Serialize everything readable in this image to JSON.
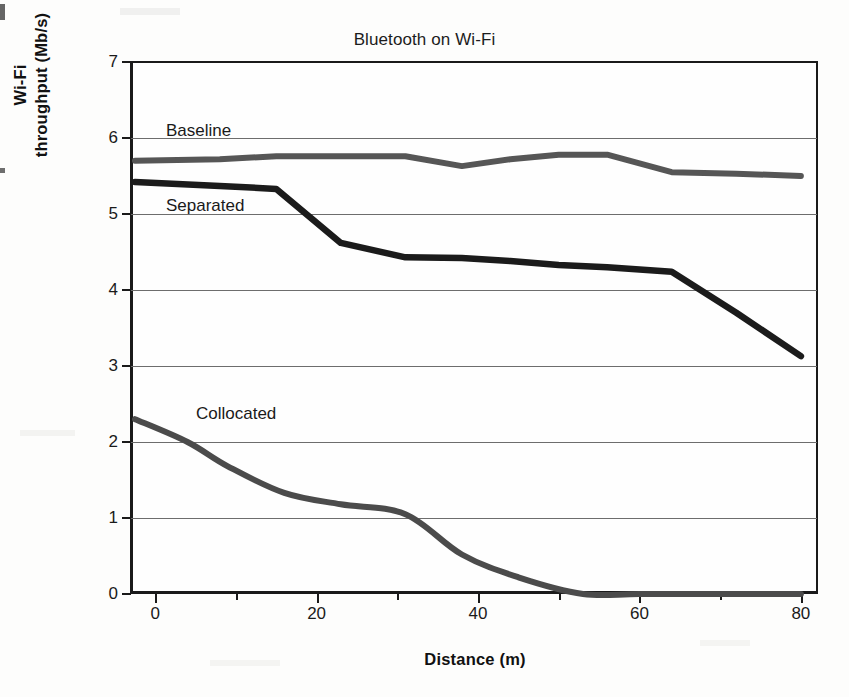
{
  "chart_data": {
    "type": "line",
    "title": "Bluetooth on Wi-Fi",
    "xlabel": "Distance (m)",
    "ylabel_line1": "Wi-Fi",
    "ylabel_line2": "throughput (Mb/s)",
    "ylabel": "Wi-Fi throughput (Mb/s)",
    "xlim": [
      -3,
      82
    ],
    "ylim": [
      0,
      7
    ],
    "xticks": [
      0,
      20,
      40,
      60,
      80
    ],
    "xtick_labels": [
      "0",
      "20",
      "40",
      "60",
      "80"
    ],
    "xticks_minor": [
      10,
      30,
      50,
      70
    ],
    "yticks": [
      0,
      1,
      2,
      3,
      4,
      5,
      6,
      7
    ],
    "ytick_labels": [
      "0",
      "1",
      "2",
      "3",
      "4",
      "5",
      "6",
      "7"
    ],
    "grid": "horizontal",
    "legend_position": "inline-annotations",
    "annotations": [
      {
        "text": "Baseline",
        "x": 5,
        "y": 5.95
      },
      {
        "text": "Separated",
        "x": 5,
        "y": 4.96
      },
      {
        "text": "Collocated",
        "x": 10,
        "y": 2.22
      }
    ],
    "series": [
      {
        "name": "Baseline",
        "color": "#565656",
        "x": [
          -2.5,
          8,
          15,
          23,
          31,
          38,
          44,
          50,
          56,
          64,
          72,
          80
        ],
        "y": [
          5.7,
          5.72,
          5.76,
          5.76,
          5.76,
          5.63,
          5.72,
          5.78,
          5.78,
          5.55,
          5.53,
          5.5
        ]
      },
      {
        "name": "Separated",
        "color": "#1b1b1b",
        "x": [
          -2.5,
          8,
          15,
          23,
          31,
          38,
          44,
          50,
          56,
          64,
          72,
          80
        ],
        "y": [
          5.42,
          5.37,
          5.33,
          4.62,
          4.43,
          4.42,
          4.38,
          4.33,
          4.3,
          4.24,
          3.7,
          3.13
        ]
      },
      {
        "name": "Collocated",
        "color": "#4b4b4b",
        "x": [
          -2.5,
          4,
          9,
          16,
          23,
          31,
          38,
          45,
          53,
          60,
          70,
          80
        ],
        "y": [
          2.3,
          2.0,
          1.68,
          1.33,
          1.18,
          1.05,
          0.52,
          0.22,
          0.0,
          0.0,
          0.0,
          0.0
        ]
      }
    ]
  }
}
